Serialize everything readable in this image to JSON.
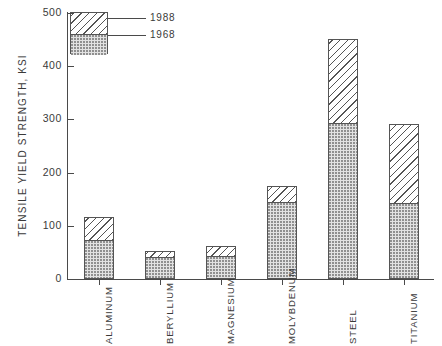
{
  "chart_data": {
    "type": "bar",
    "title": "",
    "subtitle": "",
    "xlabel": "",
    "ylabel": "TENSILE  YIELD  STRENGTH,  KSI",
    "ylim": [
      0,
      500
    ],
    "yticks": [
      0,
      100,
      200,
      300,
      400,
      500
    ],
    "ytick_labels": [
      "0",
      "100",
      "200",
      "300",
      "400",
      "500"
    ],
    "grid": false,
    "legend_position": "top-left",
    "stacked_display": "overlay",
    "categories": [
      "ALUMINUM",
      "BERYLLIUM",
      "MAGNESIUM",
      "MOLYBDENUM",
      "STEEL",
      "TITANIUM"
    ],
    "series": [
      {
        "name": "1988",
        "pattern": "diagonal-hatch",
        "values": [
          117,
          53,
          62,
          175,
          452,
          292
        ]
      },
      {
        "name": "1968",
        "pattern": "stipple",
        "values": [
          73,
          42,
          43,
          145,
          293,
          143
        ]
      }
    ]
  },
  "legend": {
    "entries": [
      {
        "label": "1988",
        "pattern": "diagonal-hatch"
      },
      {
        "label": "1968",
        "pattern": "stipple"
      }
    ]
  },
  "colors": {
    "axis": "#4a4a4a",
    "outline": "#555555",
    "stipple_fill": "#e2e2e2",
    "stipple_dot": "#8d8d8d",
    "hatch_fill": "#ffffff",
    "hatch_line": "#555555",
    "text": "#3a3a3a",
    "background": "#ffffff"
  }
}
